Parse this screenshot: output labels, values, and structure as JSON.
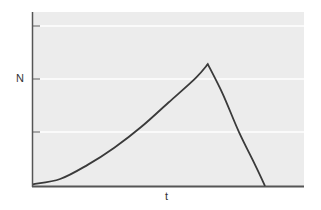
{
  "chart_data": {
    "type": "line",
    "title": "",
    "xlabel": "t",
    "ylabel": "N",
    "grid": true,
    "legend": null,
    "x_ticks": [],
    "y_ticks_count": 3,
    "xlim": [
      0,
      1
    ],
    "ylim": [
      0,
      1
    ],
    "series": [
      {
        "name": "N(t)",
        "description": "Accelerating (exponential-like) growth to a peak, followed by a steep decline to zero",
        "points": [
          {
            "x": 0.0,
            "y": 0.01
          },
          {
            "x": 0.1,
            "y": 0.04
          },
          {
            "x": 0.2,
            "y": 0.12
          },
          {
            "x": 0.3,
            "y": 0.22
          },
          {
            "x": 0.4,
            "y": 0.34
          },
          {
            "x": 0.5,
            "y": 0.48
          },
          {
            "x": 0.6,
            "y": 0.62
          },
          {
            "x": 0.645,
            "y": 0.7
          },
          {
            "x": 0.7,
            "y": 0.53
          },
          {
            "x": 0.76,
            "y": 0.31
          },
          {
            "x": 0.82,
            "y": 0.12
          },
          {
            "x": 0.856,
            "y": 0.0
          }
        ]
      }
    ],
    "colors": {
      "plot_background": "#ececec",
      "gridline": "#ffffff",
      "line": "#3a3a3a",
      "axis": "#555555"
    }
  },
  "labels": {
    "y_axis": "N",
    "x_axis": "t"
  }
}
